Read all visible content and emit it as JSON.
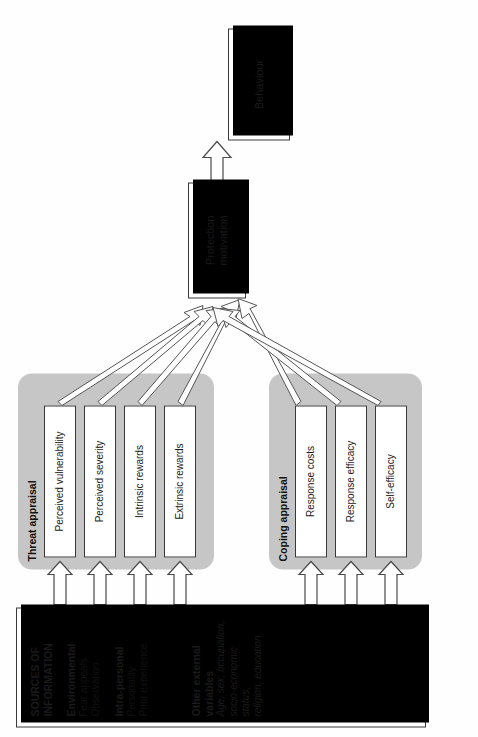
{
  "diagram": {
    "orientation": "rotated-90-ccw",
    "colors": {
      "panel_gray": "#c6c6c6",
      "box_fill": "#ffffff",
      "box_border": "#3a3a3a",
      "shadow": "#000000",
      "text": "#111111"
    }
  },
  "outcome": {
    "behaviour_label": "Behaviour",
    "protection_motivation_label": "Protection\nmotivation",
    "protection_motivation_line1": "Protection",
    "protection_motivation_line2": "motivation"
  },
  "threat_appraisal": {
    "group_label": "Threat appraisal",
    "factors": [
      {
        "label": "Perceived vulnerability"
      },
      {
        "label": "Perceived severity"
      },
      {
        "label": "Intrinsic rewards"
      },
      {
        "label": "Extrinsic rewards"
      }
    ]
  },
  "coping_appraisal": {
    "group_label": "Coping appraisal",
    "factors": [
      {
        "label": "Response costs"
      },
      {
        "label": "Response efficacy"
      },
      {
        "label": "Self-efficacy"
      }
    ]
  },
  "sources": {
    "heading_line1": "SOURCES OF",
    "heading_line2": "INFORMATION",
    "environmental_heading": "Environmental",
    "environmental_items": [
      "Fear appeals",
      "Observation"
    ],
    "intrapersonal_heading": "Intra-personal",
    "intrapersonal_items": [
      "Personality",
      "Prior experience"
    ],
    "other_heading_line1": "Other external",
    "other_heading_line2": "variables",
    "other_items_line1": "Age, sex, occupation,",
    "other_items_line2": "socio-economic status,",
    "other_items_line3": "religion, education"
  }
}
